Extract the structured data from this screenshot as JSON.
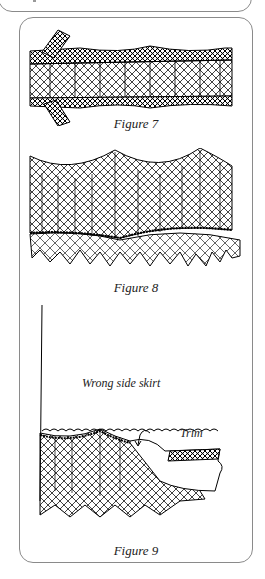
{
  "page": {
    "previous_box": "partial-frame-above"
  },
  "figures": [
    {
      "caption": "Figure 7",
      "illustration": "lace-insertion-band-with-tape-end"
    },
    {
      "caption": "Figure 8",
      "illustration": "scalloped-lace-with-ruffled-edge"
    },
    {
      "caption": "Figure 9",
      "illustration": "lace-attached-to-skirt-trim",
      "labels": {
        "skirt": "Wrong side skirt",
        "trim": "Trim"
      }
    }
  ]
}
